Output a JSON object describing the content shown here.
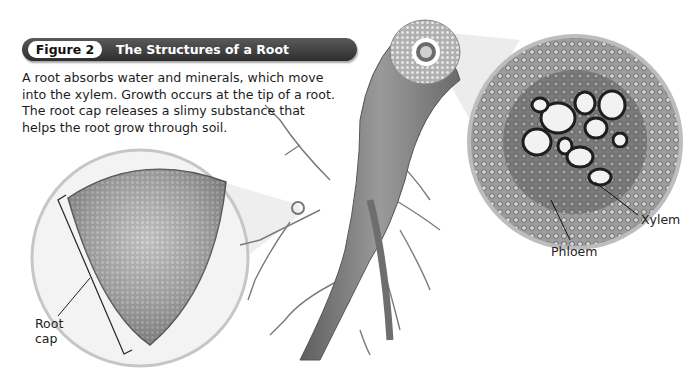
{
  "figure": {
    "number_label": "Figure 2",
    "title": "The Structures of a Root",
    "caption": "A root absorbs water and minerals, which move into the xylem. Growth occurs at the tip of a root. The root cap releases a slimy substance that helps the root grow through soil."
  },
  "labels": {
    "root_cap_line1": "Root",
    "root_cap_line2": "cap",
    "xylem": "Xylem",
    "phloem": "Phloem"
  },
  "illustrations": {
    "root_tip_magnified": "root-tip-micrograph",
    "root_branching": "root-drawing",
    "vascular_cross_section": "xylem-phloem-micrograph"
  },
  "colors": {
    "header_bar": "#3a3a3a",
    "header_pill": "#ffffff",
    "text": "#1d1d1d"
  }
}
